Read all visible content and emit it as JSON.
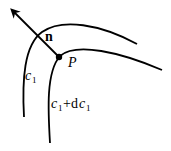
{
  "diagram": {
    "curves": [
      {
        "id": "c1",
        "label": "c",
        "subscript": "1"
      },
      {
        "id": "c1-plus-dc1",
        "label_parts": [
          "c",
          "1",
          "+d",
          "c",
          "1"
        ]
      }
    ],
    "point": {
      "label": "P"
    },
    "normal_vector": {
      "label": "n"
    },
    "colors": {
      "stroke": "#000000",
      "background": "#ffffff"
    }
  }
}
